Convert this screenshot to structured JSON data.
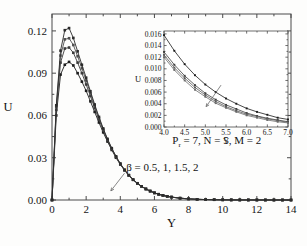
{
  "figure": {
    "background_color": "#fdfdfc",
    "frame_color": "#4a4a4a"
  },
  "chart_data": [
    {
      "id": "main",
      "type": "line",
      "title": "",
      "xlabel": "Y",
      "ylabel": "U",
      "xlim": [
        0,
        14
      ],
      "ylim": [
        0,
        0.132
      ],
      "grid": false,
      "legend": "none",
      "xticks": [
        "0",
        "2",
        "4",
        "6",
        "8",
        "10",
        "12",
        "14"
      ],
      "xtick_values": [
        0,
        2,
        4,
        6,
        8,
        10,
        12,
        14
      ],
      "yticks": [
        "0.00",
        "0.03",
        "0.06",
        "0.09",
        "0.12"
      ],
      "ytick_values": [
        0.0,
        0.03,
        0.06,
        0.09,
        0.12
      ],
      "minor_x_count": 1,
      "minor_y_count": 1,
      "marker": "square",
      "annotations": [
        {
          "name": "beta-annotation",
          "text": "β = 0.5, 1, 1.5, 2",
          "x": 4.35,
          "y": 0.0205,
          "arrow_from": [
            4.25,
            0.019
          ],
          "arrow_to": [
            3.45,
            0.0065
          ]
        },
        {
          "name": "parameters-annotation",
          "symbol": "P",
          "subscript": "r",
          "text": " = 7, N = 5, M = 2",
          "x": 7.05,
          "y": 0.0395
        }
      ],
      "series": [
        {
          "name": "beta = 0.5",
          "color": "#1c1c1c",
          "x": [
            0.0,
            0.25,
            0.5,
            0.75,
            1.0,
            1.25,
            1.5,
            1.75,
            2.0,
            2.25,
            2.5,
            2.75,
            3.0,
            3.25,
            3.5,
            3.75,
            4.0,
            4.25,
            4.5,
            4.75,
            5.0,
            5.25,
            5.5,
            5.75,
            6.0,
            6.25,
            6.5,
            6.75,
            7.0,
            7.5,
            8.0,
            8.5,
            9.0,
            9.5,
            10.0,
            10.5,
            11.0,
            11.5,
            12.0,
            12.5,
            13.0,
            13.5,
            14.0
          ],
          "y": [
            0.0,
            0.06,
            0.089,
            0.096,
            0.098,
            0.0955,
            0.09,
            0.084,
            0.0775,
            0.07,
            0.0625,
            0.055,
            0.048,
            0.0415,
            0.0355,
            0.03,
            0.0252,
            0.021,
            0.0174,
            0.0143,
            0.0118,
            0.0096,
            0.0078,
            0.0063,
            0.0051,
            0.0041,
            0.0033,
            0.0026,
            0.0021,
            0.0013,
            0.0008,
            0.0005,
            0.0003,
            0.0002,
            0.00012,
            7e-05,
            4e-05,
            3e-05,
            2e-05,
            1e-05,
            1e-05,
            0.0,
            0.0
          ]
        },
        {
          "name": "beta = 1",
          "color": "#3a3a3a",
          "x": [
            0.0,
            0.25,
            0.5,
            0.75,
            1.0,
            1.25,
            1.5,
            1.75,
            2.0,
            2.25,
            2.5,
            2.75,
            3.0,
            3.25,
            3.5,
            3.75,
            4.0,
            4.25,
            4.5,
            4.75,
            5.0,
            5.25,
            5.5,
            5.75,
            6.0,
            6.25,
            6.5,
            6.75,
            7.0,
            7.5,
            8.0,
            8.5,
            9.0,
            9.5,
            10.0,
            10.5,
            11.0,
            11.5,
            12.0,
            12.5,
            13.0,
            13.5,
            14.0
          ],
          "y": [
            0.0,
            0.064,
            0.0975,
            0.1075,
            0.1082,
            0.1045,
            0.0975,
            0.09,
            0.082,
            0.0738,
            0.0652,
            0.057,
            0.0494,
            0.0424,
            0.0361,
            0.0305,
            0.0255,
            0.0212,
            0.0175,
            0.0144,
            0.0118,
            0.0096,
            0.0078,
            0.0063,
            0.005,
            0.004,
            0.0032,
            0.0026,
            0.002,
            0.0013,
            0.0008,
            0.0005,
            0.0003,
            0.0002,
            0.00012,
            7e-05,
            4e-05,
            3e-05,
            2e-05,
            1e-05,
            1e-05,
            0.0,
            0.0
          ]
        },
        {
          "name": "beta = 1.5",
          "color": "#4f4f4f",
          "x": [
            0.0,
            0.25,
            0.5,
            0.75,
            1.0,
            1.25,
            1.5,
            1.75,
            2.0,
            2.25,
            2.5,
            2.75,
            3.0,
            3.25,
            3.5,
            3.75,
            4.0,
            4.25,
            4.5,
            4.75,
            5.0,
            5.25,
            5.5,
            5.75,
            6.0,
            6.25,
            6.5,
            6.75,
            7.0,
            7.5,
            8.0,
            8.5,
            9.0,
            9.5,
            10.0,
            10.5,
            11.0,
            11.5,
            12.0,
            12.5,
            13.0,
            13.5,
            14.0
          ],
          "y": [
            0.0,
            0.066,
            0.1025,
            0.114,
            0.1148,
            0.11,
            0.102,
            0.0935,
            0.0848,
            0.0758,
            0.0668,
            0.0582,
            0.0502,
            0.043,
            0.0365,
            0.0307,
            0.0257,
            0.0213,
            0.0176,
            0.0144,
            0.0118,
            0.0096,
            0.0078,
            0.0063,
            0.005,
            0.004,
            0.0032,
            0.0025,
            0.002,
            0.0013,
            0.0008,
            0.0005,
            0.0003,
            0.0002,
            0.00012,
            7e-05,
            4e-05,
            3e-05,
            2e-05,
            1e-05,
            1e-05,
            0.0,
            0.0
          ]
        },
        {
          "name": "beta = 2",
          "color": "#2b2b2b",
          "x": [
            0.0,
            0.25,
            0.5,
            0.75,
            1.0,
            1.25,
            1.5,
            1.75,
            2.0,
            2.25,
            2.5,
            2.75,
            3.0,
            3.25,
            3.5,
            3.75,
            4.0,
            4.25,
            4.5,
            4.75,
            5.0,
            5.25,
            5.5,
            5.75,
            6.0,
            6.25,
            6.5,
            6.75,
            7.0,
            7.5,
            8.0,
            8.5,
            9.0,
            9.5,
            10.0,
            10.5,
            11.0,
            11.5,
            12.0,
            12.5,
            13.0,
            13.5,
            14.0
          ],
          "y": [
            0.0,
            0.0672,
            0.106,
            0.1205,
            0.122,
            0.115,
            0.1055,
            0.096,
            0.0868,
            0.0772,
            0.0678,
            0.059,
            0.0508,
            0.0434,
            0.0368,
            0.031,
            0.0259,
            0.0215,
            0.0177,
            0.0145,
            0.0119,
            0.0097,
            0.0079,
            0.0064,
            0.0051,
            0.0041,
            0.0033,
            0.0026,
            0.0021,
            0.0013,
            0.0008,
            0.0005,
            0.0003,
            0.0002,
            0.00012,
            7e-05,
            4e-05,
            3e-05,
            2e-05,
            1e-05,
            1e-05,
            0.0,
            0.0
          ]
        }
      ]
    },
    {
      "id": "inset",
      "type": "line",
      "title": "",
      "xlabel": "Y",
      "ylabel": "U",
      "xlim": [
        4.0,
        7.0
      ],
      "ylim": [
        0.0,
        0.0165
      ],
      "grid": false,
      "legend": "none",
      "xticks": [
        "4.0",
        "4.5",
        "5.0",
        "5.5",
        "6.0",
        "6.5",
        "7.0"
      ],
      "xtick_values": [
        4.0,
        4.5,
        5.0,
        5.5,
        6.0,
        6.5,
        7.0
      ],
      "yticks": [
        "0.000",
        "0.002",
        "0.004",
        "0.006",
        "0.008",
        "0.010",
        "0.012",
        "0.014",
        "0.016"
      ],
      "ytick_values": [
        0.0,
        0.002,
        0.004,
        0.006,
        0.008,
        0.01,
        0.012,
        0.014,
        0.016
      ],
      "marker": "square",
      "annotations": [
        {
          "name": "inset-arrow",
          "text": "",
          "arrow_from": [
            5.38,
            0.0072
          ],
          "arrow_to": [
            5.02,
            0.0035
          ]
        }
      ],
      "series": [
        {
          "name": "beta = 2",
          "color": "#1c1c1c",
          "x": [
            4.0,
            4.25,
            4.5,
            4.75,
            5.0,
            5.25,
            5.5,
            5.75,
            6.0,
            6.25,
            6.5,
            6.75,
            7.0
          ],
          "y": [
            0.0158,
            0.0131,
            0.0108,
            0.0089,
            0.0073,
            0.006,
            0.0049,
            0.004,
            0.0032,
            0.0026,
            0.0021,
            0.0016,
            0.0013
          ]
        },
        {
          "name": "beta = 1.5",
          "color": "#3d3d3d",
          "x": [
            4.0,
            4.25,
            4.5,
            4.75,
            5.0,
            5.25,
            5.5,
            5.75,
            6.0,
            6.25,
            6.5,
            6.75,
            7.0
          ],
          "y": [
            0.0129,
            0.0107,
            0.0088,
            0.0072,
            0.0058,
            0.0047,
            0.0038,
            0.0031,
            0.0024,
            0.0019,
            0.0015,
            0.0012,
            0.0009
          ]
        },
        {
          "name": "beta = 1",
          "color": "#585858",
          "x": [
            4.0,
            4.25,
            4.5,
            4.75,
            5.0,
            5.25,
            5.5,
            5.75,
            6.0,
            6.25,
            6.5,
            6.75,
            7.0
          ],
          "y": [
            0.0124,
            0.0102,
            0.0084,
            0.0068,
            0.0055,
            0.0044,
            0.0035,
            0.0028,
            0.0022,
            0.0018,
            0.0014,
            0.0011,
            0.0008
          ]
        },
        {
          "name": "beta = 0.5",
          "color": "#6b6b6b",
          "x": [
            4.0,
            4.25,
            4.5,
            4.75,
            5.0,
            5.25,
            5.5,
            5.75,
            6.0,
            6.25,
            6.5,
            6.75,
            7.0
          ],
          "y": [
            0.012,
            0.0098,
            0.008,
            0.0064,
            0.0052,
            0.0041,
            0.0033,
            0.0026,
            0.002,
            0.0016,
            0.0012,
            0.0009,
            0.0007
          ]
        }
      ]
    }
  ]
}
